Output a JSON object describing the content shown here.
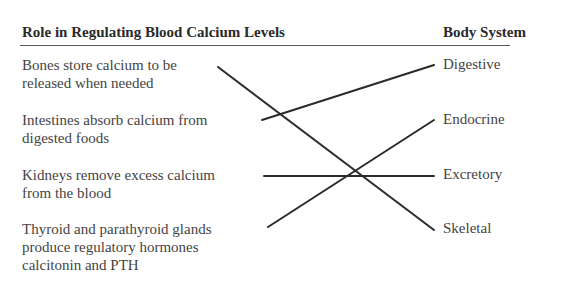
{
  "headers": {
    "role": "Role in Regulating Blood Calcium Levels",
    "system": "Body System"
  },
  "roles": [
    {
      "line1": "Bones store calcium to be",
      "line2": "released when needed"
    },
    {
      "line1": "Intestines absorb calcium from",
      "line2": "digested foods"
    },
    {
      "line1": "Kidneys remove excess calcium",
      "line2": "from the blood"
    },
    {
      "line1": "Thyroid and parathyroid glands",
      "line2": "produce regulatory hormones",
      "line3": "calcitonin and PTH"
    }
  ],
  "systems": [
    "Digestive",
    "Endocrine",
    "Excretory",
    "Skeletal"
  ],
  "matches": [
    {
      "role": "Bones store calcium to be released when needed",
      "system": "Skeletal"
    },
    {
      "role": "Intestines absorb calcium from digested foods",
      "system": "Digestive"
    },
    {
      "role": "Kidneys remove excess calcium from the blood",
      "system": "Excretory"
    },
    {
      "role": "Thyroid and parathyroid glands produce regulatory hormones calcitonin and PTH",
      "system": "Endocrine"
    }
  ]
}
